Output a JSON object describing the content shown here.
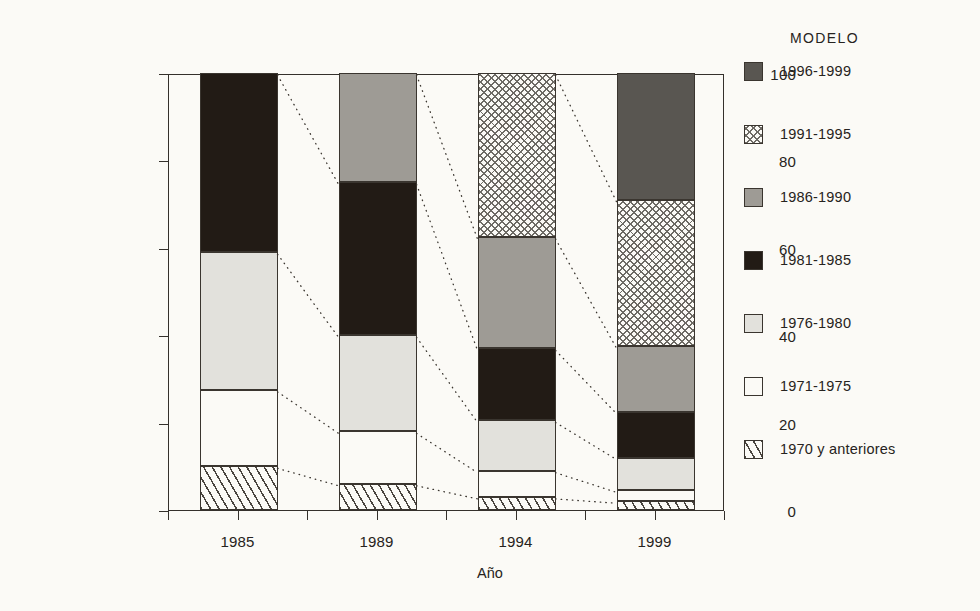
{
  "chart_data": {
    "type": "bar",
    "subtype": "stacked-bar-100-percent",
    "title": "",
    "xlabel": "Año",
    "ylabel": "Porcentaje del parque vehicular\npor categoría de edad",
    "categories": [
      "1985",
      "1989",
      "1994",
      "1999"
    ],
    "ylim": [
      0,
      100
    ],
    "yticks": [
      0,
      20,
      40,
      60,
      80,
      100
    ],
    "ytick_labels": [
      "0",
      "20",
      "40",
      "60",
      "80",
      "100"
    ],
    "grid": false,
    "legend_position": "right",
    "legend_title": "Modelo",
    "stack_order_bottom_to_top": [
      "1970 y anteriores",
      "1971-1975",
      "1976-1980",
      "1981-1985",
      "1986-1990",
      "1991-1995",
      "1996-1999"
    ],
    "series": [
      {
        "name": "1970 y anteriores",
        "fill": "hatch",
        "color": "#fbfaf6",
        "values": [
          10,
          6,
          3,
          2
        ]
      },
      {
        "name": "1971-1975",
        "fill": "solid",
        "color": "#fbfaf6",
        "values": [
          17.5,
          12,
          6,
          2.5
        ]
      },
      {
        "name": "1976-1980",
        "fill": "solid",
        "color": "#e2e1dc",
        "values": [
          31.5,
          22,
          11.5,
          7.5
        ]
      },
      {
        "name": "1981-1985",
        "fill": "solid",
        "color": "#221b15",
        "values": [
          41,
          35,
          16.5,
          10.5
        ]
      },
      {
        "name": "1986-1990",
        "fill": "solid",
        "color": "#9e9b95",
        "values": [
          0,
          25,
          25.5,
          15
        ]
      },
      {
        "name": "1991-1995",
        "fill": "crosshatch",
        "color": "#fbfaf6",
        "values": [
          0,
          0,
          37.5,
          33.5
        ]
      },
      {
        "name": "1996-1999",
        "fill": "solid",
        "color": "#595651",
        "values": [
          0,
          0,
          0,
          29
        ]
      }
    ],
    "cumulative_boundaries": {
      "1985": [
        0,
        10,
        27.5,
        59,
        100
      ],
      "1989": [
        0,
        6,
        18,
        40,
        75,
        100
      ],
      "1994": [
        0,
        3,
        9,
        20.5,
        37,
        62.5,
        100
      ],
      "1999": [
        0,
        2,
        4.5,
        12,
        22.5,
        37.5,
        71,
        100
      ]
    }
  },
  "legend": {
    "title": "Modelo",
    "items": [
      {
        "label": "1996-1999",
        "swatch": "dark-gray-swatch"
      },
      {
        "label": "1991-1995",
        "swatch": "crosshatch-swatch"
      },
      {
        "label": "1986-1990",
        "swatch": "mid-gray-swatch"
      },
      {
        "label": "1981-1985",
        "swatch": "black-swatch"
      },
      {
        "label": "1976-1980",
        "swatch": "light-gray-swatch"
      },
      {
        "label": "1971-1975",
        "swatch": "white-swatch"
      },
      {
        "label": "1970 y anteriores",
        "swatch": "hatch-swatch"
      }
    ]
  },
  "axes": {
    "x_title": "Año",
    "y_title": "Porcentaje del parque vehicular\npor categoría de edad",
    "x_labels": [
      "1985",
      "1989",
      "1994",
      "1999"
    ],
    "y_labels": [
      "100",
      "80",
      "60",
      "40",
      "20",
      "0"
    ]
  },
  "colors": {
    "background": "#fbfaf6",
    "ink": "#262320",
    "dark_gray": "#595651",
    "mid_gray": "#9e9b95",
    "light_gray": "#e2e1dc",
    "black": "#221b15",
    "white": "#fbfaf6"
  }
}
